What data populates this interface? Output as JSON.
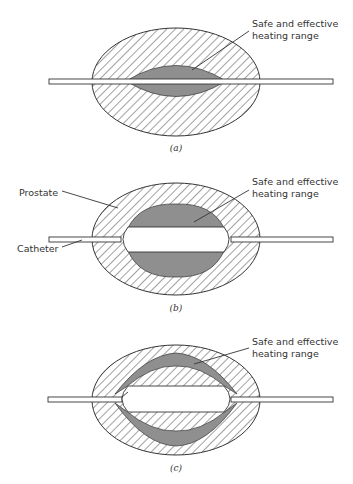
{
  "figure": {
    "panels": [
      {
        "id": "a",
        "caption": "(a)",
        "labels": {
          "heating": [
            "Safe and effective",
            "heating range"
          ]
        }
      },
      {
        "id": "b",
        "caption": "(b)",
        "labels": {
          "prostate": "Prostate",
          "catheter": "Catheter",
          "heating": [
            "Safe and effective",
            "heating range"
          ]
        }
      },
      {
        "id": "c",
        "caption": "(c)",
        "labels": {
          "heating": [
            "Safe and effective",
            "heating range"
          ]
        }
      }
    ],
    "colors": {
      "heating_zone": "#8f8f8f",
      "hatch_line": "#444444",
      "outline": "#333333",
      "background": "#ffffff"
    }
  }
}
